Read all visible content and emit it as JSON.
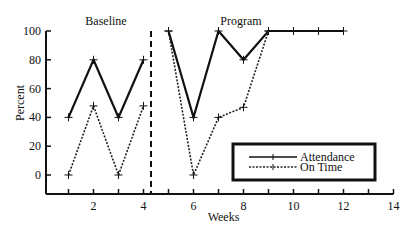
{
  "chart_data": {
    "type": "line",
    "title": "",
    "xlabel": "Weeks",
    "ylabel": "Percent",
    "xlim": [
      0,
      14
    ],
    "ylim": [
      -13,
      100
    ],
    "x_ticks": [
      1,
      2,
      3,
      4,
      5,
      6,
      7,
      8,
      9,
      10,
      11,
      12,
      13,
      14
    ],
    "x_tick_labels": [
      "",
      "2",
      "",
      "4",
      "",
      "6",
      "",
      "8",
      "",
      "10",
      "",
      "12",
      "",
      "14"
    ],
    "y_ticks": [
      0,
      20,
      40,
      60,
      80,
      100
    ],
    "y_tick_labels": [
      "0",
      "20",
      "40",
      "60",
      "80",
      "100"
    ],
    "grid": false,
    "phase_change_x": 4.3,
    "phases": [
      {
        "label": "Baseline",
        "center_x": 2.5
      },
      {
        "label": "Program",
        "center_x": 7.9
      }
    ],
    "legend_position": "lower-right",
    "series": [
      {
        "name": "Attendance",
        "style": "solid",
        "segments": [
          {
            "x": [
              1,
              2,
              3,
              4
            ],
            "y": [
              40,
              80,
              40,
              80
            ]
          },
          {
            "x": [
              5,
              6,
              7,
              8,
              9,
              10,
              11,
              12
            ],
            "y": [
              100,
              40,
              100,
              80,
              100,
              100,
              100,
              100
            ]
          }
        ]
      },
      {
        "name": "On Time",
        "style": "dotted",
        "segments": [
          {
            "x": [
              1,
              2,
              3,
              4
            ],
            "y": [
              0,
              48,
              0,
              48
            ]
          },
          {
            "x": [
              5,
              6,
              7,
              8,
              9
            ],
            "y": [
              100,
              0,
              40,
              47,
              100
            ]
          }
        ]
      }
    ]
  }
}
